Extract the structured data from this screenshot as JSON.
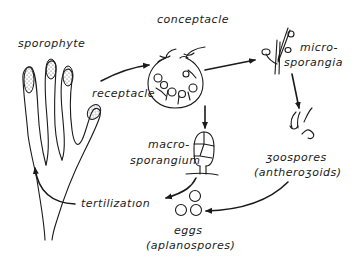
{
  "diagram": {
    "type": "life-cycle",
    "nodes": [
      {
        "id": "sporophyte",
        "label": "sporophyte"
      },
      {
        "id": "receptacle",
        "label": "receptacle"
      },
      {
        "id": "conceptacle",
        "label": "conceptacle"
      },
      {
        "id": "microsporangia",
        "label_line1": "micro-",
        "label_line2": "sporangia"
      },
      {
        "id": "zoospores",
        "label_line1": "ʒoospores",
        "label_line2": "(antheroʒoids)"
      },
      {
        "id": "macrosporangium",
        "label_line1": "macro-",
        "label_line2": "sporangium"
      },
      {
        "id": "eggs",
        "label_line1": "eggs",
        "label_line2": "(aplanospores)"
      },
      {
        "id": "fertilization",
        "label": "tertilizatıon"
      }
    ],
    "edges": [
      {
        "from": "receptacle",
        "to": "conceptacle"
      },
      {
        "from": "conceptacle",
        "to": "microsporangia"
      },
      {
        "from": "conceptacle",
        "to": "macrosporangium"
      },
      {
        "from": "microsporangia",
        "to": "zoospores"
      },
      {
        "from": "zoospores",
        "to": "eggs"
      },
      {
        "from": "macrosporangium",
        "to": "fertilization"
      },
      {
        "from": "fertilization",
        "to": "sporophyte"
      }
    ]
  }
}
